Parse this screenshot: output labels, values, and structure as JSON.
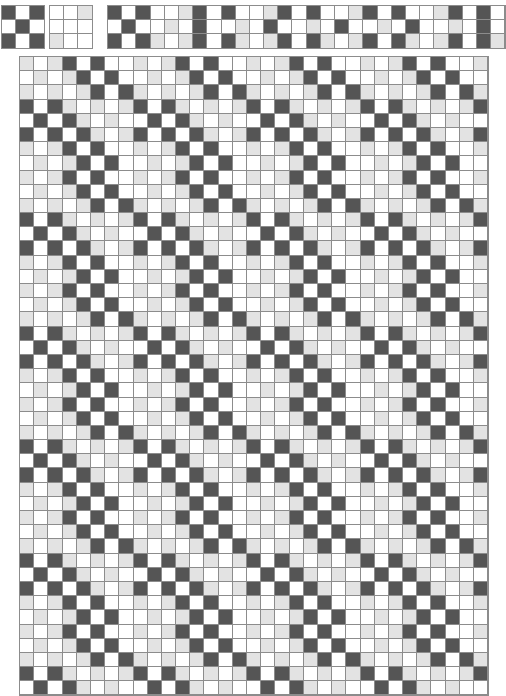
{
  "document": {
    "title": "Weave Draft Pattern",
    "type": "weaving-drawdown"
  },
  "palette": {
    "dark": "#555555",
    "light": "#e3e3e3",
    "white": "#ffffff",
    "gridline": "#8c8c8c",
    "background": "#ffffff"
  },
  "geometry": {
    "cell_size": 13.2,
    "canvas_width": 478,
    "canvas_height": 667
  },
  "threading_block": {
    "label": "threading-block",
    "columns": 3,
    "rows": 3,
    "cells": [
      [
        "dark",
        "white",
        "dark"
      ],
      [
        "white",
        "dark",
        "white"
      ],
      [
        "dark",
        "white",
        "dark"
      ]
    ]
  },
  "tieup_block": {
    "label": "tieup-block",
    "columns": 3,
    "rows": 3,
    "cells": [
      [
        "white",
        "white",
        "light"
      ],
      [
        "white",
        "white",
        "white"
      ],
      [
        "light",
        "white",
        "white"
      ]
    ]
  },
  "treadling_strip": {
    "label": "treadling-strip",
    "columns": 28,
    "rows": 3,
    "cells": [
      [
        "dark",
        "white",
        "dark",
        "white",
        "white",
        "light",
        "dark",
        "white",
        "dark",
        "white",
        "white",
        "light",
        "dark",
        "white",
        "dark",
        "white",
        "white",
        "light",
        "dark",
        "white",
        "dark",
        "white",
        "white",
        "light",
        "dark",
        "white",
        "dark",
        "white"
      ],
      [
        "white",
        "dark",
        "white",
        "white",
        "light",
        "white",
        "dark",
        "white",
        "white",
        "light",
        "white",
        "dark",
        "white",
        "white",
        "light",
        "white",
        "dark",
        "white",
        "white",
        "light",
        "white",
        "dark",
        "white",
        "white",
        "light",
        "white",
        "dark",
        "white"
      ],
      [
        "dark",
        "white",
        "dark",
        "light",
        "white",
        "light",
        "dark",
        "white",
        "dark",
        "light",
        "white",
        "light",
        "dark",
        "white",
        "dark",
        "light",
        "white",
        "light",
        "dark",
        "white",
        "dark",
        "light",
        "white",
        "light",
        "dark",
        "white",
        "dark",
        "light"
      ]
    ]
  },
  "drawdown": {
    "label": "drawdown-grid",
    "columns": 33,
    "rows": 45,
    "period_x": 8,
    "period_y": 8,
    "description": "Diagonal twill drawdown with three tones: dark warp floats, light-grey half tones and white weft floats, repeating every 8 ends and 8 picks.",
    "tile": [
      [
        "light",
        "white",
        "light",
        "dark",
        "white",
        "dark",
        "white",
        "white"
      ],
      [
        "white",
        "light",
        "white",
        "light",
        "dark",
        "white",
        "dark",
        "white"
      ],
      [
        "light",
        "white",
        "light",
        "white",
        "light",
        "dark",
        "white",
        "dark"
      ],
      [
        "dark",
        "white",
        "dark",
        "light",
        "white",
        "light",
        "white",
        "light"
      ],
      [
        "white",
        "dark",
        "white",
        "dark",
        "light",
        "white",
        "light",
        "white"
      ],
      [
        "dark",
        "white",
        "dark",
        "white",
        "dark",
        "light",
        "white",
        "light"
      ],
      [
        "light",
        "white",
        "light",
        "dark",
        "white",
        "dark",
        "white",
        "white"
      ],
      [
        "white",
        "light",
        "white",
        "light",
        "dark",
        "white",
        "dark",
        "white"
      ]
    ]
  }
}
